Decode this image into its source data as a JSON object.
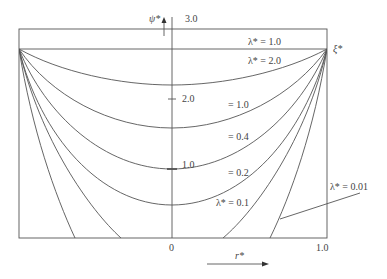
{
  "axes": {
    "y_label": "ψ*",
    "x_label": "r*",
    "right_label": "ξ*",
    "y_ticks": [
      "3.0",
      "2.0",
      "1.0"
    ],
    "x_ticks": [
      "0",
      "1.0"
    ]
  },
  "curves": [
    {
      "label": "λ* = 1.0"
    },
    {
      "label": "λ* = 2.0"
    },
    {
      "label": "= 1.0"
    },
    {
      "label": "= 0.4"
    },
    {
      "label": "= 0.2"
    },
    {
      "label": "λ* = 0.1"
    },
    {
      "label": "λ* = 0.01"
    }
  ],
  "colors": {
    "line": "#555555",
    "text": "#444444"
  }
}
